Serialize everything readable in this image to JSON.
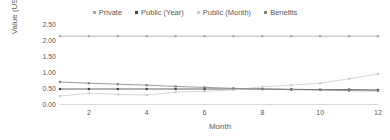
{
  "chart_data": {
    "type": "line",
    "title": "",
    "xlabel": "Month",
    "ylabel": "Value (USD)",
    "x": [
      1,
      2,
      3,
      4,
      5,
      6,
      7,
      8,
      9,
      10,
      11,
      12
    ],
    "xlim": [
      1,
      12
    ],
    "ylim": [
      0.0,
      2.5
    ],
    "xticks": [
      "2",
      "4",
      "6",
      "8",
      "10",
      "12"
    ],
    "xtick_values": [
      2,
      4,
      6,
      8,
      10,
      12
    ],
    "yticks": [
      "0.00",
      "0.50",
      "1.00",
      "1.50",
      "2.00",
      "2.50"
    ],
    "ytick_values": [
      0.0,
      0.5,
      1.0,
      1.5,
      2.0,
      2.5
    ],
    "grid": false,
    "legend_position": "top",
    "series": [
      {
        "name": "Private",
        "color": "#a6a6a6",
        "marker": "square",
        "values": [
          2.15,
          2.15,
          2.15,
          2.15,
          2.15,
          2.15,
          2.15,
          2.15,
          2.15,
          2.15,
          2.15,
          2.15
        ]
      },
      {
        "name": "Public (Year)",
        "color": "#404040",
        "marker": "square",
        "values": [
          0.5,
          0.5,
          0.5,
          0.5,
          0.5,
          0.5,
          0.5,
          0.5,
          0.49,
          0.48,
          0.48,
          0.47
        ]
      },
      {
        "name": "Public (Month)",
        "color": "#cccccc",
        "marker": "square",
        "values": [
          0.28,
          0.37,
          0.33,
          0.31,
          0.4,
          0.43,
          0.47,
          0.57,
          0.62,
          0.68,
          0.82,
          0.97
        ]
      },
      {
        "name": "Benefits",
        "color": "#808080",
        "marker": "square",
        "values": [
          0.72,
          0.68,
          0.65,
          0.62,
          0.58,
          0.55,
          0.52,
          0.5,
          0.48,
          0.47,
          0.45,
          0.44
        ]
      }
    ]
  },
  "legend": {
    "entries": [
      {
        "label": "Private"
      },
      {
        "label": "Public (Year)"
      },
      {
        "label": "Public (Month)"
      },
      {
        "label": "Benefits"
      }
    ]
  },
  "axes": {
    "y_title": "Value (USD)",
    "x_title": "Month"
  },
  "colors": {
    "axis_line": "#d9d9d9",
    "tick_text": "#5a5a5a"
  }
}
